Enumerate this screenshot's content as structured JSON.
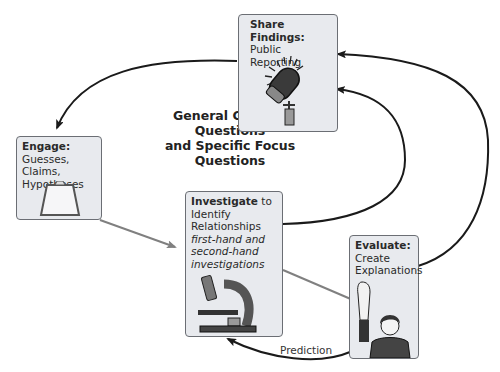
{
  "diagram": {
    "center_title": [
      "General Guiding Questions",
      "and Specific Focus",
      "Questions"
    ],
    "nodes": {
      "share": {
        "title": "Share Findings:",
        "subtitle": "Public Reporting",
        "icon": "microphone-icon"
      },
      "engage": {
        "title": "Engage:",
        "lines": [
          "Guesses, Claims,",
          "Hypotheses"
        ],
        "icon": "clipboard-icon"
      },
      "investigate": {
        "title": "Investigate",
        "title_suffix": " to",
        "lines": [
          "Identify",
          "Relationships"
        ],
        "italic_lines": [
          "first-hand and",
          "second-hand",
          "investigations"
        ],
        "icon": "microscope-icon"
      },
      "evaluate": {
        "title": "Evaluate:",
        "lines": [
          "Create",
          "Explanations"
        ],
        "icon": "student-raising-hand-icon"
      }
    },
    "edges": [
      {
        "from": "share",
        "to": "engage",
        "label": ""
      },
      {
        "from": "engage",
        "to": "investigate",
        "label": ""
      },
      {
        "from": "investigate",
        "to": "evaluate",
        "label": ""
      },
      {
        "from": "investigate",
        "to": "share",
        "label": ""
      },
      {
        "from": "evaluate",
        "to": "share",
        "label": ""
      },
      {
        "from": "evaluate",
        "to": "investigate",
        "label": "Prediction"
      }
    ],
    "colors": {
      "box_fill": "#e8eaee",
      "box_border": "#6b6e74",
      "arrow_dark": "#1a1a1a",
      "arrow_gray": "#808080"
    }
  }
}
